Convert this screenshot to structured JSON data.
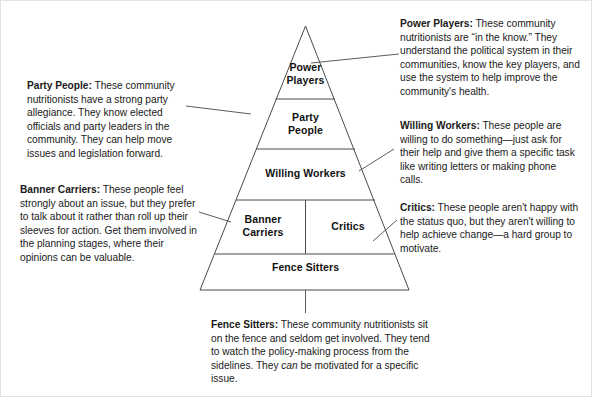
{
  "diagram": {
    "line_color": "#4a4a4a",
    "text_color": "#1a1a1a",
    "background": "#ffffff"
  },
  "pyramid": {
    "tiers": [
      {
        "id": "power-players",
        "label": "Power\nPlayers"
      },
      {
        "id": "party-people",
        "label": "Party\nPeople"
      },
      {
        "id": "willing-workers",
        "label": "Willing Workers"
      },
      {
        "id": "banner-carriers",
        "label": "Banner\nCarriers"
      },
      {
        "id": "critics",
        "label": "Critics"
      },
      {
        "id": "fence-sitters",
        "label": "Fence Sitters"
      }
    ]
  },
  "callouts": {
    "power_players": {
      "term": "Power Players:",
      "body": " These community nutritionists are “in the know.” They understand the political system in their communities, know the key players, and use the system to help improve the community's health."
    },
    "willing_workers": {
      "term": "Willing Workers:",
      "body": " These people are willing to do something—just ask for their help and give them a specific task like writing letters or making phone calls."
    },
    "critics": {
      "term": "Critics:",
      "body": " These people aren't happy with the status quo, but they aren't willing to help achieve change—a hard group to motivate."
    },
    "party_people": {
      "term": "Party People:",
      "body": " These community nutritionists have a strong party allegiance. They know elected officials and party leaders in the community. They can help move issues and legislation forward."
    },
    "banner_carriers": {
      "term": "Banner Carriers:",
      "body": " These people feel strongly about an issue, but they prefer to talk about it rather than roll up their sleeves for action. Get them involved in the planning stages, where their opinions can be valuable."
    },
    "fence_sitters": {
      "term": "Fence Sitters:",
      "body_part1": " These community nutritionists sit on the fence and seldom get involved. They tend to watch the policy-making process from the sidelines. They ",
      "emphasis": "can",
      "body_part2": " be motivated for a specific issue."
    }
  }
}
